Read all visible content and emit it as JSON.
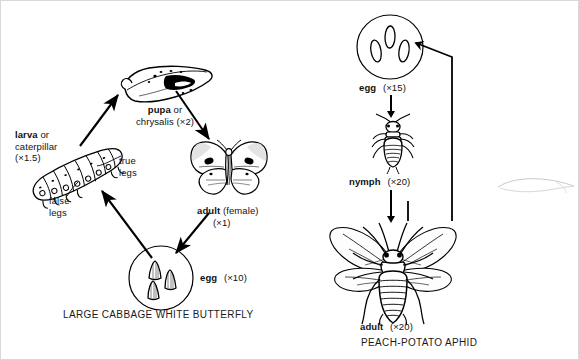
{
  "figure": {
    "type": "biology-life-cycle-diagram",
    "panels": [
      {
        "id": "butterfly",
        "caption": "LARGE CABBAGE WHITE BUTTERFLY",
        "metamorphosis": "complete",
        "stages": [
          {
            "name": "larva",
            "alt": "caterpillar",
            "label_main": "larva",
            "label_or": " or",
            "label_alt": "caterpillar",
            "magnification": "(×1.5)"
          },
          {
            "name": "pupa",
            "alt": "chrysalis",
            "label_main": "pupa",
            "label_or": " or",
            "label_alt": "chrysalis",
            "magnification": "(×2)"
          },
          {
            "name": "adult",
            "label_main": "adult",
            "qualifier": " (female)",
            "magnification": "(×1)"
          },
          {
            "name": "egg",
            "label_main": "egg",
            "magnification": "(×10)"
          }
        ],
        "annotations": [
          {
            "id": "true-legs",
            "line1": "true",
            "line2": "legs"
          },
          {
            "id": "false-legs",
            "line1": "false",
            "line2": "legs"
          }
        ]
      },
      {
        "id": "aphid",
        "caption": "PEACH-POTATO APHID",
        "metamorphosis": "incomplete",
        "stages": [
          {
            "name": "egg",
            "label_main": "egg",
            "magnification": "(×15)"
          },
          {
            "name": "nymph",
            "label_main": "nymph",
            "magnification": "(×20)"
          },
          {
            "name": "adult",
            "label_main": "adult",
            "magnification": "(×20)"
          }
        ]
      }
    ],
    "colors": {
      "ink": "#000000",
      "paper": "#ffffff",
      "border": "#d8d8d8",
      "stray_mark": "#c9c9c9"
    }
  }
}
